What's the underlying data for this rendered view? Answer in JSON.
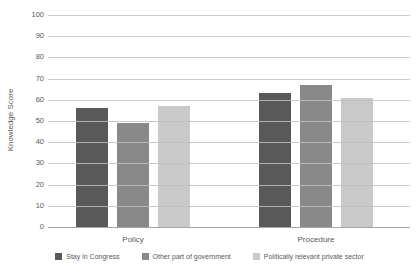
{
  "chart_data": {
    "type": "bar",
    "title": "",
    "categories": [
      "Policy",
      "Procedure"
    ],
    "series": [
      {
        "name": "Stay in Congress",
        "color": "#595959",
        "values": [
          56,
          63
        ]
      },
      {
        "name": "Other part of government",
        "color": "#898989",
        "values": [
          49,
          67
        ]
      },
      {
        "name": "Politically relevant private sector",
        "color": "#c9c9c9",
        "values": [
          57,
          61
        ]
      }
    ],
    "xlabel": "",
    "ylabel": "Knowledge Score",
    "ylim": [
      0,
      100
    ],
    "ytick_step": 10,
    "ytick_labels": [
      "0",
      "10",
      "20",
      "30",
      "40",
      "50",
      "60",
      "70",
      "80",
      "90",
      "100"
    ],
    "grid": true,
    "gridline_color": "#bfbfbf",
    "text_color": "#595959",
    "legend_position": "bottom"
  }
}
